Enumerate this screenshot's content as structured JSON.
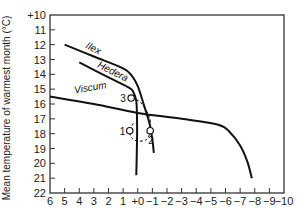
{
  "chart_data": {
    "type": "line",
    "title": "",
    "xlabel": "",
    "ylabel": "Mean temperature of warmest month (°C)",
    "xlim": [
      6,
      -10
    ],
    "ylim": [
      10,
      22
    ],
    "y_inverted": true,
    "grid": false,
    "x_ticks": [
      6,
      5,
      4,
      3,
      2,
      1,
      0,
      -1,
      -2,
      -3,
      -4,
      -5,
      -6,
      -7,
      -8,
      -9,
      -10
    ],
    "x_tick_labels": [
      "6",
      "5",
      "4",
      "3",
      "2",
      "1",
      "+0",
      "−1",
      "−2",
      "−3",
      "−4",
      "−5",
      "−6",
      "−7",
      "−8",
      "−9",
      "−10"
    ],
    "y_ticks": [
      10,
      11,
      12,
      13,
      14,
      15,
      16,
      17,
      18,
      19,
      20,
      21,
      22
    ],
    "y_tick_labels": [
      "+10",
      "11",
      "12",
      "13",
      "14",
      "15",
      "16",
      "17",
      "18",
      "19",
      "20",
      "21",
      "22"
    ],
    "series": [
      {
        "name": "Ilex",
        "points": [
          [
            5,
            12.0
          ],
          [
            3,
            12.8
          ],
          [
            1,
            13.6
          ],
          [
            0.4,
            14.1
          ],
          [
            0.0,
            14.8
          ],
          [
            -0.4,
            16.0
          ],
          [
            -0.8,
            17.3
          ],
          [
            -1.0,
            18.4
          ],
          [
            -1.1,
            19.3
          ]
        ]
      },
      {
        "name": "Hedera",
        "points": [
          [
            4,
            13.2
          ],
          [
            2,
            14.2
          ],
          [
            0.6,
            14.9
          ],
          [
            0.3,
            15.2
          ],
          [
            0.1,
            15.8
          ],
          [
            0.05,
            17.0
          ],
          [
            0.05,
            18.5
          ],
          [
            0.1,
            20.8
          ]
        ]
      },
      {
        "name": "Viscum",
        "points": [
          [
            6,
            15.5
          ],
          [
            3,
            16.0
          ],
          [
            0,
            16.6
          ],
          [
            -3,
            17.0
          ],
          [
            -5.5,
            17.4
          ],
          [
            -6.3,
            17.9
          ],
          [
            -7.0,
            18.8
          ],
          [
            -7.5,
            19.9
          ],
          [
            -7.8,
            21.0
          ]
        ]
      }
    ],
    "markers": [
      {
        "label": "1",
        "x": 0.55,
        "y": 17.8
      },
      {
        "label": "2",
        "x": -0.85,
        "y": 17.8
      },
      {
        "label": "3",
        "x": 0.45,
        "y": 15.6
      }
    ],
    "marker_path": [
      [
        0.45,
        15.6
      ],
      [
        -0.2,
        15.9
      ],
      [
        -0.8,
        16.9
      ],
      [
        -0.85,
        17.8
      ],
      [
        -0.6,
        18.4
      ],
      [
        0.0,
        18.5
      ],
      [
        0.4,
        18.3
      ],
      [
        0.55,
        17.8
      ],
      [
        0.3,
        17.3
      ]
    ]
  }
}
